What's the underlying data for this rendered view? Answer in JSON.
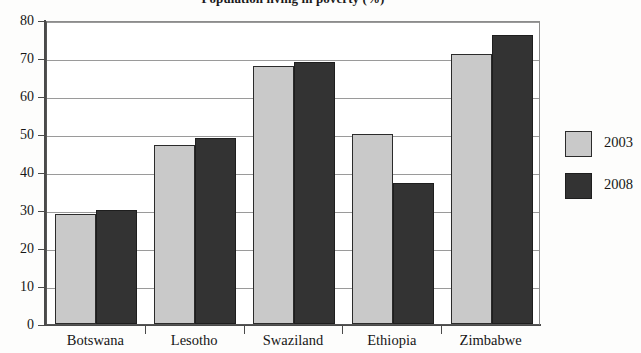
{
  "chart_data": {
    "type": "bar",
    "title": "Population living in poverty (%)",
    "xlabel": "",
    "ylabel": "",
    "categories": [
      "Botswana",
      "Lesotho",
      "Swaziland",
      "Ethiopia",
      "Zimbabwe"
    ],
    "series": [
      {
        "name": "2003",
        "color": "#c9c9c9",
        "values": [
          29,
          47,
          68,
          50,
          71
        ]
      },
      {
        "name": "2008",
        "color": "#333333",
        "values": [
          30,
          49,
          69,
          37,
          76
        ]
      }
    ],
    "ylim": [
      0,
      80
    ],
    "yticks": [
      0,
      10,
      20,
      30,
      40,
      50,
      60,
      70,
      80
    ],
    "ytick_labels": [
      "0",
      "10",
      "20",
      "30",
      "40",
      "50",
      "60",
      "70",
      "80"
    ],
    "grid": true,
    "legend_position": "right",
    "legend_entries": [
      "2003",
      "2008"
    ]
  }
}
